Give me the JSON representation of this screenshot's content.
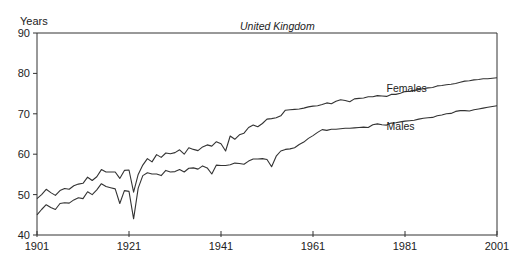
{
  "chart_data": {
    "type": "line",
    "title": "United Kingdom",
    "xlabel": "",
    "ylabel": "Years",
    "xlim": [
      1901,
      2001
    ],
    "ylim": [
      40,
      90
    ],
    "x_ticks": [
      1901,
      1921,
      1941,
      1961,
      1981,
      2001
    ],
    "y_ticks": [
      40,
      50,
      60,
      70,
      80,
      90
    ],
    "grid": false,
    "legend": "inline labels",
    "series": [
      {
        "name": "Females",
        "label_pos": {
          "x": 1977,
          "y": 75.5
        },
        "x": [
          1901,
          1902,
          1903,
          1904,
          1905,
          1906,
          1907,
          1908,
          1909,
          1910,
          1911,
          1912,
          1913,
          1914,
          1915,
          1916,
          1917,
          1918,
          1919,
          1920,
          1921,
          1922,
          1923,
          1924,
          1925,
          1926,
          1927,
          1928,
          1929,
          1930,
          1931,
          1932,
          1933,
          1934,
          1935,
          1936,
          1937,
          1938,
          1939,
          1940,
          1941,
          1942,
          1943,
          1944,
          1945,
          1946,
          1947,
          1948,
          1949,
          1950,
          1951,
          1952,
          1953,
          1954,
          1955,
          1956,
          1957,
          1958,
          1959,
          1960,
          1961,
          1962,
          1963,
          1964,
          1965,
          1966,
          1967,
          1968,
          1969,
          1970,
          1971,
          1972,
          1973,
          1974,
          1975,
          1976,
          1977,
          1978,
          1979,
          1980,
          1981,
          1982,
          1983,
          1984,
          1985,
          1986,
          1987,
          1988,
          1989,
          1990,
          1991,
          1992,
          1993,
          1994,
          1995,
          1996,
          1997,
          1998,
          1999,
          2000,
          2001
        ],
        "values": [
          49.0,
          50.0,
          51.3,
          50.5,
          49.8,
          51.0,
          51.5,
          51.3,
          52.2,
          52.6,
          52.8,
          54.3,
          53.5,
          54.4,
          56.2,
          55.6,
          55.6,
          55.6,
          54.0,
          56.0,
          56.1,
          50.6,
          55.0,
          57.3,
          58.9,
          58.1,
          59.9,
          59.2,
          60.3,
          60.1,
          60.4,
          61.1,
          60.0,
          61.6,
          61.2,
          60.9,
          61.8,
          62.3,
          62.0,
          63.1,
          62.6,
          60.8,
          64.5,
          63.7,
          64.8,
          65.2,
          66.6,
          67.2,
          66.8,
          67.6,
          68.7,
          68.8,
          69.0,
          69.5,
          70.9,
          71.0,
          71.1,
          71.2,
          71.4,
          71.7,
          71.9,
          72.0,
          72.3,
          72.7,
          72.5,
          73.1,
          73.5,
          73.3,
          73.0,
          73.7,
          73.8,
          73.9,
          74.2,
          74.2,
          74.5,
          74.4,
          74.3,
          74.8,
          74.8,
          75.1,
          75.5,
          75.6,
          75.8,
          76.0,
          76.2,
          76.4,
          76.5,
          76.9,
          77.0,
          77.2,
          77.3,
          77.5,
          77.8,
          78.1,
          78.2,
          78.4,
          78.5,
          78.7,
          78.7,
          78.8,
          78.9
        ]
      },
      {
        "name": "Males",
        "label_pos": {
          "x": 1977,
          "y": 66.0
        },
        "x": [
          1901,
          1902,
          1903,
          1904,
          1905,
          1906,
          1907,
          1908,
          1909,
          1910,
          1911,
          1912,
          1913,
          1914,
          1915,
          1916,
          1917,
          1918,
          1919,
          1920,
          1921,
          1922,
          1923,
          1924,
          1925,
          1926,
          1927,
          1928,
          1929,
          1930,
          1931,
          1932,
          1933,
          1934,
          1935,
          1936,
          1937,
          1938,
          1939,
          1940,
          1941,
          1942,
          1943,
          1944,
          1945,
          1946,
          1947,
          1948,
          1949,
          1950,
          1951,
          1952,
          1953,
          1954,
          1955,
          1956,
          1957,
          1958,
          1959,
          1960,
          1961,
          1962,
          1963,
          1964,
          1965,
          1966,
          1967,
          1968,
          1969,
          1970,
          1971,
          1972,
          1973,
          1974,
          1975,
          1976,
          1977,
          1978,
          1979,
          1980,
          1981,
          1982,
          1983,
          1984,
          1985,
          1986,
          1987,
          1988,
          1989,
          1990,
          1991,
          1992,
          1993,
          1994,
          1995,
          1996,
          1997,
          1998,
          1999,
          2000,
          2001
        ],
        "values": [
          45.0,
          46.3,
          47.5,
          46.8,
          46.3,
          47.8,
          48.0,
          47.9,
          48.7,
          49.2,
          49.0,
          50.7,
          50.0,
          51.2,
          52.7,
          52.0,
          51.7,
          51.4,
          47.8,
          51.0,
          50.8,
          44.0,
          51.6,
          54.7,
          55.4,
          55.1,
          55.1,
          54.7,
          56.0,
          55.6,
          55.7,
          56.2,
          55.6,
          56.5,
          56.6,
          56.3,
          57.1,
          56.6,
          55.1,
          57.3,
          57.2,
          57.2,
          57.4,
          57.8,
          57.7,
          57.5,
          58.3,
          58.8,
          58.8,
          58.9,
          58.7,
          56.9,
          59.5,
          60.8,
          61.2,
          61.3,
          61.6,
          62.4,
          63.0,
          63.9,
          64.6,
          65.4,
          66.1,
          65.9,
          66.2,
          66.2,
          66.3,
          66.4,
          66.4,
          66.5,
          66.6,
          66.7,
          66.6,
          67.3,
          67.5,
          67.3,
          67.2,
          67.7,
          67.8,
          68.0,
          68.2,
          68.3,
          68.4,
          68.7,
          68.9,
          69.0,
          69.1,
          69.5,
          69.7,
          70.0,
          70.1,
          70.6,
          70.8,
          70.8,
          70.7,
          71.0,
          71.2,
          71.4,
          71.6,
          71.8,
          72.0
        ]
      }
    ]
  },
  "colors": {
    "line": "#333333",
    "axis": "#333333",
    "background": "#ffffff"
  }
}
